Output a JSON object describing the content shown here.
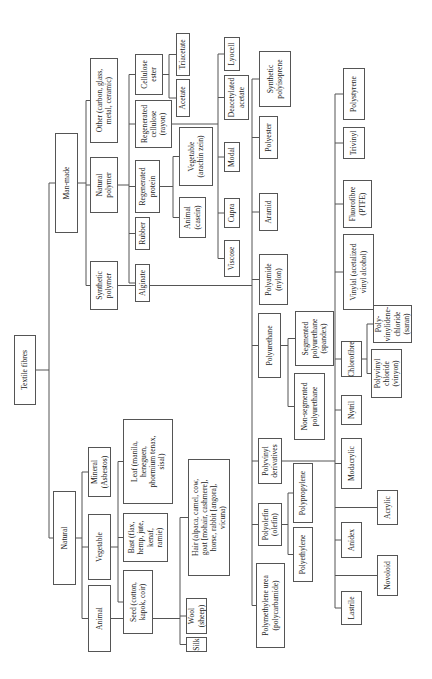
{
  "title": "Textile fibres",
  "nodes": {
    "root": "Textile fibres",
    "natural": "Natural",
    "man_made": "Man-made",
    "animal": "Animal",
    "vegetable": "Vegetable",
    "mineral": "Mineral\n(Asbestos)",
    "seed": "Seed (cotton,\nkapok, coir)",
    "bast": "Bast (flax,\nhemp, jute,\nkenaf,\nramie)",
    "leaf": "Leaf (manila,\nheneguen,\nphormium tenax,\nsisal)",
    "silk": "Silk",
    "wool": "Wool\n(sheep)",
    "hair": "Hair (alpaca, camel, cow,\ngoat [mohair, cashmere],\nhorse, rabbit [angora],\nvicuna)",
    "synthetic_polymer": "Synthetic\npolymer",
    "natural_polymer": "Natural\npolymer",
    "other": "Other (carbon, glass,\nmetal, ceramic)",
    "alginate": "Alginate",
    "rubber": "Rubber",
    "regenerated_protein": "Regenerated\nprotein",
    "regenerated_cellulose": "Regenerated\ncellulose\n(rayon)",
    "cellulose_ester": "Cellulose\nester",
    "acetate": "Acetate",
    "triacetate": "Triacetate",
    "animal_casein": "Animal\n(casein)",
    "vegetable_zein": "Vegetable\n(arachin zein)",
    "viscose": "Viscose",
    "cupra": "Cupra",
    "modal": "Modal",
    "deacetylated_acetate": "Deacetylated\nacetate",
    "lyocell": "Lyocell",
    "polyamide": "Polyamide\n(nylon)",
    "aramid": "Aramid",
    "polyester": "Polyester",
    "synthetic_polyisoprene": "Synthetic\npolyisoprene",
    "polyurethane": "Polyurethane",
    "segmented_pu": "Segmented\npolyurethane\n(spandex)",
    "non_segmented_pu": "Non-segmented\npolyurethane",
    "polymethylene_urea": "Polymethylene urea\n(polycarbamide)",
    "polyolefin": "Polyolefin\n(olefin)",
    "polyvinyl_derivatives": "Polyvinyl\nderivatives",
    "polyethylene": "Polyethylene",
    "polypropylene": "Polypropylene",
    "lastrile": "Lastrile",
    "novoloid": "Novoloid",
    "anidex": "Anidex",
    "acrylic": "Acrylic",
    "modacrylic": "Modacrylic",
    "nytril": "Nytril",
    "chlorofibre": "Chlorofibre",
    "pvc": "Polyvinyl\nchloride\n(vinyon)",
    "pvdc": "Poly-\nvinylidene-\nchloride\n(saran)",
    "vinylal": "Vinylal (acetalized\nvinyl alcohol)",
    "fluorofibre": "Fluorofibre\n(PTFE)",
    "trivinyl": "Trivinyl",
    "polystyrene": "Polystyrene"
  }
}
